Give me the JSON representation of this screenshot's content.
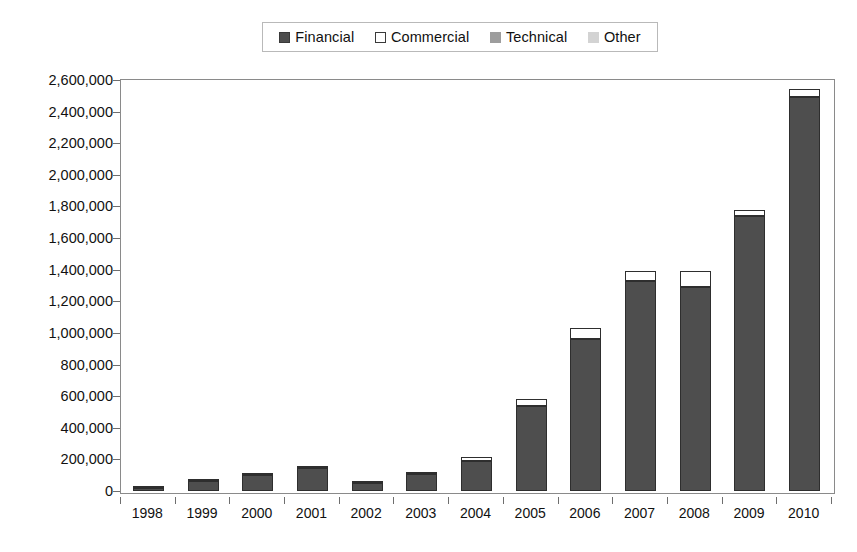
{
  "chart_data": {
    "type": "bar",
    "subtype": "stacked-column",
    "title": "",
    "subtitle": "",
    "xlabel": "",
    "ylabel": "",
    "categories": [
      "1998",
      "1999",
      "2000",
      "2001",
      "2002",
      "2003",
      "2004",
      "2005",
      "2006",
      "2007",
      "2008",
      "2009",
      "2010"
    ],
    "series": [
      {
        "name": "Financial",
        "color": "#4e4e4e",
        "values": [
          20000,
          62000,
          100000,
          148000,
          48000,
          110000,
          190000,
          535000,
          960000,
          1330000,
          1290000,
          1740000,
          2490000
        ]
      },
      {
        "name": "Commercial",
        "color": "#ffffff",
        "values": [
          2000,
          4000,
          6000,
          5000,
          3000,
          8000,
          25000,
          45000,
          70000,
          60000,
          105000,
          35000,
          55000
        ]
      },
      {
        "name": "Technical",
        "color": "#9d9d9d",
        "values": [
          0,
          0,
          0,
          0,
          0,
          0,
          0,
          0,
          0,
          0,
          0,
          0,
          0
        ]
      },
      {
        "name": "Other",
        "color": "#d3d3d3",
        "values": [
          0,
          0,
          0,
          0,
          0,
          0,
          0,
          0,
          0,
          0,
          0,
          0,
          0
        ]
      }
    ],
    "totals": [
      22000,
      66000,
      106000,
      153000,
      51000,
      118000,
      215000,
      580000,
      1030000,
      1390000,
      1395000,
      1775000,
      2545000
    ],
    "ylim": [
      0,
      2600000
    ],
    "y_tick_step": 200000,
    "y_ticks": [
      0,
      200000,
      400000,
      600000,
      800000,
      1000000,
      1200000,
      1400000,
      1600000,
      1800000,
      2000000,
      2200000,
      2400000,
      2600000
    ],
    "y_tick_labels": [
      "0",
      "200,000",
      "400,000",
      "600,000",
      "800,000",
      "1,000,000",
      "1,200,000",
      "1,400,000",
      "1,600,000",
      "1,800,000",
      "2,000,000",
      "2,200,000",
      "2,400,000",
      "2,600,000"
    ],
    "grid": false,
    "legend_position": "top",
    "legend_entries": [
      "Financial",
      "Commercial",
      "Technical",
      "Other"
    ]
  },
  "legend": {
    "items": [
      {
        "label": "Financial",
        "swatch": "legend-swatch-financial"
      },
      {
        "label": "Commercial",
        "swatch": "legend-swatch-commercial"
      },
      {
        "label": "Technical",
        "swatch": "legend-swatch-technical"
      },
      {
        "label": "Other",
        "swatch": "legend-swatch-other"
      }
    ]
  },
  "colors": {
    "financial": "#4e4e4e",
    "commercial": "#ffffff",
    "technical": "#9d9d9d",
    "other": "#d3d3d3",
    "axis": "#8a8a8a",
    "text": "#111111",
    "background": "#ffffff"
  }
}
